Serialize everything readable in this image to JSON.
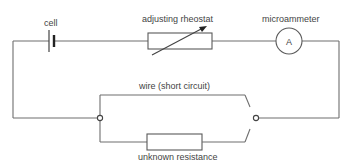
{
  "diagram": {
    "type": "circuit",
    "labels": {
      "cell": "cell",
      "rheostat": "adjusting rheostat",
      "ammeter": "microammeter",
      "short_wire": "wire (short circuit)",
      "unknown": "unknown resistance"
    },
    "ammeter_symbol": "A",
    "components": [
      {
        "id": "cell",
        "kind": "battery-cell"
      },
      {
        "id": "rheostat",
        "kind": "variable-resistor"
      },
      {
        "id": "ammeter",
        "kind": "meter"
      },
      {
        "id": "short_wire",
        "kind": "wire"
      },
      {
        "id": "unknown",
        "kind": "resistor"
      },
      {
        "id": "switch",
        "kind": "two-way-switch"
      }
    ],
    "colors": {
      "wire": "#6e6e6e",
      "text": "#444444",
      "background": "#ffffff"
    }
  }
}
